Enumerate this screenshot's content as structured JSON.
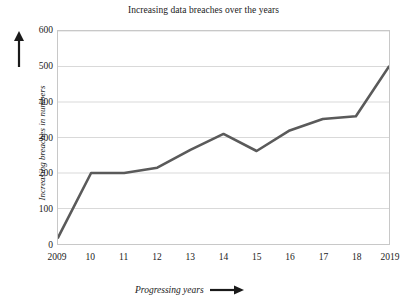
{
  "chart_data": {
    "type": "line",
    "title": "Increasing data breaches over the years",
    "xlabel": "Progressing years",
    "ylabel": "Increasing breaches in numbers",
    "categories": [
      "2009",
      "10",
      "11",
      "12",
      "13",
      "14",
      "15",
      "16",
      "17",
      "18",
      "2019"
    ],
    "values": [
      18,
      200,
      200,
      215,
      265,
      310,
      262,
      320,
      352,
      360,
      500
    ],
    "series": [
      {
        "name": "Data breaches",
        "values": [
          18,
          200,
          200,
          215,
          265,
          310,
          262,
          320,
          352,
          360,
          500
        ]
      }
    ],
    "ylim": [
      0,
      600
    ],
    "yticks": [
      "0",
      "100",
      "200",
      "300",
      "400",
      "500",
      "600"
    ],
    "ytick_values": [
      0,
      100,
      200,
      300,
      400,
      500,
      600
    ],
    "grid": "horizontal",
    "legend": "none",
    "line_color": "#5a5a5a",
    "grid_color": "#d9d9d9",
    "frame_color": "#c8c8c8",
    "text_color": "#1a1a1a",
    "markers": "none"
  },
  "axis_arrows": {
    "y_arrow": "up-arrow-icon",
    "x_arrow": "right-arrow-icon"
  }
}
